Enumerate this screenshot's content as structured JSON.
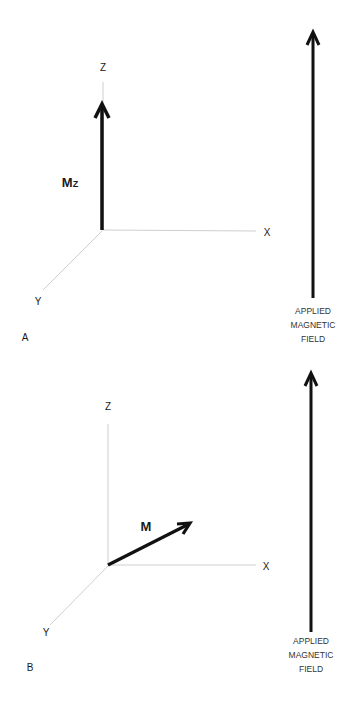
{
  "panels": [
    {
      "id": "A",
      "panel_label": "A",
      "axes": {
        "x": "X",
        "y": "Y",
        "z": "Z"
      },
      "vector_label": "M",
      "vector_subscript": "Z",
      "vector_direction": "along +Z",
      "field_label_lines": [
        "APPLIED",
        "MAGNETIC",
        "FIELD"
      ]
    },
    {
      "id": "B",
      "panel_label": "B",
      "axes": {
        "x": "X",
        "y": "Y",
        "z": "Z"
      },
      "vector_label": "M",
      "vector_direction": "tilted toward X",
      "field_label_lines": [
        "APPLIED",
        "MAGNETIC",
        "FIELD"
      ]
    }
  ],
  "colors": {
    "axis": "#c8c8c8",
    "vector": "#111111",
    "text": "#1a1a1a",
    "background": "#ffffff"
  }
}
